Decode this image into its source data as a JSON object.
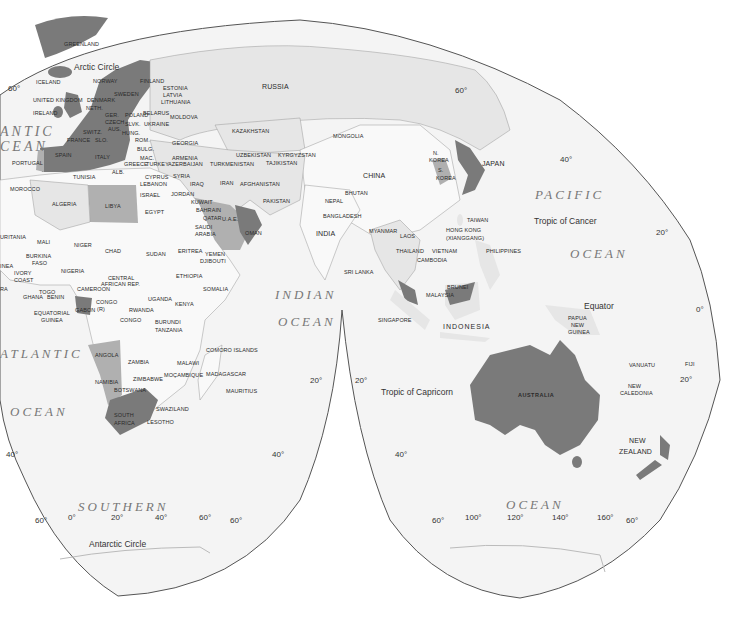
{
  "map": {
    "projection": "interrupted world map (Eastern Hemisphere focus)",
    "colors": {
      "background": "#ffffff",
      "ocean": "#f4f4f4",
      "land_light": "#e6e6e6",
      "land_white": "#f9f9f9",
      "highlight_medium": "#b0b0b0",
      "highlight_dark": "#7a7a7a",
      "outline": "#555555"
    },
    "oceans": {
      "pacific_1": "PACIFIC",
      "pacific_2": "OCEAN",
      "atlantic_n_1": "ANTIC",
      "atlantic_n_2": "CEAN",
      "atlantic_s_1": "ATLANTIC",
      "atlantic_s_2": "OCEAN",
      "indian_1": "INDIAN",
      "indian_2": "OCEAN",
      "southern_1": "SOUTHERN",
      "southern_2": "OCEAN"
    },
    "lines": {
      "arctic_circle": "Arctic Circle",
      "tropic_cancer": "Tropic of Cancer",
      "equator": "Equator",
      "tropic_capricorn": "Tropic of Capricorn",
      "antarctic_circle": "Antarctic Circle"
    },
    "degrees": {
      "d60_nw": "60°",
      "d60_ne": "60°",
      "d40_n": "40°",
      "d20_ne": "20°",
      "d0_e": "0°",
      "d20_e": "20°",
      "d20_mid_l": "20°",
      "d20_mid_r": "20°",
      "d40_sw": "40°",
      "d40_smid_l": "40°",
      "d40_smid_r": "40°",
      "d60_sw": "60°",
      "d60_smid": "60°",
      "d60_sr_l": "60°",
      "d60_sr_r": "60°",
      "lon_0": "0°",
      "lon_20": "20°",
      "lon_40": "40°",
      "lon_60": "60°",
      "lon_100": "100°",
      "lon_120": "120°",
      "lon_140": "140°",
      "lon_160": "160°"
    },
    "countries": {
      "greenland": "GREENLAND",
      "iceland": "ICELAND",
      "norway": "NORWAY",
      "sweden": "SWEDEN",
      "finland": "FINLAND",
      "estonia": "ESTONIA",
      "latvia": "LATVIA",
      "lithuania": "LITHUANIA",
      "uk": "UNITED KINGDOM",
      "ireland": "IRELAND",
      "denmark": "DENMARK",
      "neth": "NETH.",
      "ger": "GER.",
      "poland": "POLAND",
      "belarus": "BELARUS",
      "ukraine": "UKRAINE",
      "moldova": "MOLDOVA",
      "france": "FRANCE",
      "switz": "SWITZ.",
      "aus": "AUS.",
      "czech": "CZECH",
      "slvk": "SLVK.",
      "hung": "HUNG.",
      "slo": "SLO.",
      "rom": "ROM.",
      "bulg": "BULG.",
      "mac": "MAC.",
      "greece": "GREECE",
      "alb": "ALB.",
      "italy": "ITALY",
      "spain": "SPAIN",
      "portugal": "PORTUGAL",
      "russia": "RUSSIA",
      "kazakhstan": "KAZAKHSTAN",
      "mongolia": "MONGOLIA",
      "georgia": "GEORGIA",
      "armenia": "ARMENIA",
      "azerbaijan": "AZERBAIJAN",
      "turkey": "TURKEY",
      "uzbekistan": "UZBEKISTAN",
      "kyrgyzstan": "KYRGYZSTAN",
      "turkmenistan": "TURKMENISTAN",
      "tajikistan": "TAJIKISTAN",
      "china": "CHINA",
      "n_korea_1": "N.",
      "n_korea_2": "KOREA",
      "s_korea_1": "S.",
      "s_korea_2": "KOREA",
      "japan": "JAPAN",
      "cyprus": "CYPRUS",
      "lebanon": "LEBANON",
      "syria": "SYRIA",
      "israel": "ISRAEL",
      "jordan": "JORDAN",
      "iraq": "IRAQ",
      "iran": "IRAN",
      "afghanistan": "AFGHANISTAN",
      "pakistan": "PAKISTAN",
      "kuwait": "KUWAIT",
      "bahrain": "BAHRAIN",
      "qatar": "QATAR",
      "uae": "U.A.E.",
      "saudi_1": "SAUDI",
      "saudi_2": "ARABIA",
      "oman": "OMAN",
      "yemen": "YEMEN",
      "djibouti": "DJIBOUTI",
      "nepal": "NEPAL",
      "bhutan": "BHUTAN",
      "bangladesh": "BANGLADESH",
      "india": "INDIA",
      "sri_lanka": "SRI LANKA",
      "myanmar": "MYANMAR",
      "laos": "LAOS",
      "thailand": "THAILAND",
      "vietnam": "VIETNAM",
      "cambodia": "CAMBODIA",
      "taiwan": "TAIWAN",
      "hong_kong_1": "HONG KONG",
      "hong_kong_2": "(XIANGGANG)",
      "philippines": "PHILIPPINES",
      "brunei": "BRUNEI",
      "malaysia": "MALAYSIA",
      "singapore": "SINGAPORE",
      "indonesia": "INDONESIA",
      "png_1": "PAPUA",
      "png_2": "NEW",
      "png_3": "GUINEA",
      "australia": "AUSTRALIA",
      "vanuatu": "VANUATU",
      "fiji": "FIJI",
      "new_caledonia_1": "NEW",
      "new_caledonia_2": "CALEDONIA",
      "nz_1": "NEW",
      "nz_2": "ZEALAND",
      "tunisia": "TUNISIA",
      "morocco": "MOROCCO",
      "algeria": "ALGERIA",
      "libya": "LIBYA",
      "egypt": "EGYPT",
      "mauritania": "URITANIA",
      "mali": "MALI",
      "niger": "NIGER",
      "chad": "CHAD",
      "sudan": "SUDAN",
      "eritrea": "ERITREA",
      "ethiopia": "ETHIOPIA",
      "somalia": "SOMALIA",
      "burkina_1": "BURKINA",
      "burkina_2": "FASO",
      "guinea": "INEA",
      "ivory_1": "IVORY",
      "ivory_2": "COAST",
      "ghana": "GHANA",
      "togo": "TOGO",
      "benin": "BENIN",
      "nigeria": "NIGERIA",
      "cameroon": "CAMEROON",
      "car_1": "CENTRAL",
      "car_2": "AFRICAN REP.",
      "eq_guinea_1": "EQUATORIAL",
      "eq_guinea_2": "GUINEA",
      "gabon": "GABON",
      "congo_rep": "CONGO",
      "congo_rep2": "(R)",
      "congo": "CONGO",
      "uganda": "UGANDA",
      "kenya": "KENYA",
      "rwanda": "RWANDA",
      "burundi": "BURUNDI",
      "tanzania": "TANZANIA",
      "angola": "ANGOLA",
      "zambia": "ZAMBIA",
      "malawi": "MALAWI",
      "mozambique": "MOÇAMBIQUE",
      "zimbabwe": "ZIMBABWE",
      "namibia": "NAMIBIA",
      "botswana": "BOTSWANA",
      "south_africa_1": "SOUTH",
      "south_africa_2": "AFRICA",
      "swaziland": "SWAZILAND",
      "lesotho": "LESOTHO",
      "madagascar": "MADAGASCAR",
      "mauritius": "MAURITIUS",
      "comoro": "COMORO ISLANDS",
      "sierra": "RA"
    }
  }
}
